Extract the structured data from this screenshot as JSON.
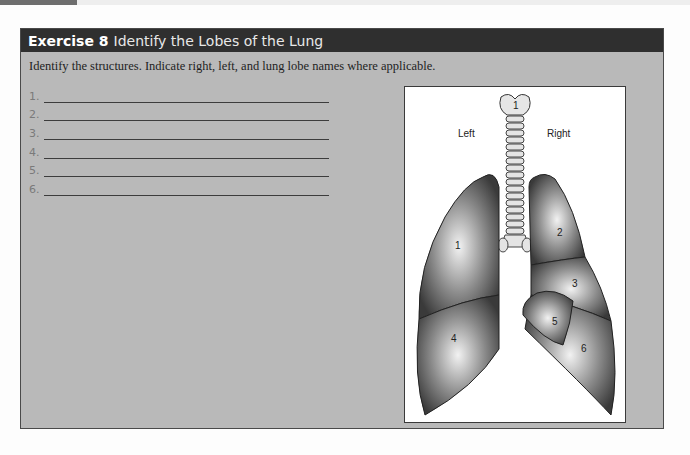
{
  "page": {
    "top_strip_color": "#eeeeee",
    "top_tab_color": "#6e6e6e"
  },
  "exercise": {
    "number_label": "Exercise 8",
    "title": "Identify the Lobes of the Lung",
    "header_bg": "#2f2f2f",
    "body_bg": "#b9b9b9",
    "instructions": "Identify the structures. Indicate right, left, and lung lobe names where applicable.",
    "answers": [
      {
        "num": "1.",
        "value": ""
      },
      {
        "num": "2.",
        "value": ""
      },
      {
        "num": "3.",
        "value": ""
      },
      {
        "num": "4.",
        "value": ""
      },
      {
        "num": "5.",
        "value": ""
      },
      {
        "num": "6.",
        "value": ""
      }
    ]
  },
  "figure": {
    "side_left": "Left",
    "side_right": "Right",
    "trachea_label": "1",
    "lobe_labels": [
      "1",
      "2",
      "3",
      "4",
      "5",
      "6"
    ]
  }
}
